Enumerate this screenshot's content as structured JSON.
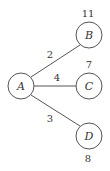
{
  "diagram": {
    "type": "weighted-graph",
    "nodes": [
      {
        "id": "A",
        "label": "A",
        "value": ""
      },
      {
        "id": "B",
        "label": "B",
        "value": "11"
      },
      {
        "id": "C",
        "label": "C",
        "value": "7"
      },
      {
        "id": "D",
        "label": "D",
        "value": "8"
      }
    ],
    "edges": [
      {
        "from": "A",
        "to": "B",
        "weight": "2"
      },
      {
        "from": "A",
        "to": "C",
        "weight": "4"
      },
      {
        "from": "A",
        "to": "D",
        "weight": "3"
      }
    ]
  }
}
